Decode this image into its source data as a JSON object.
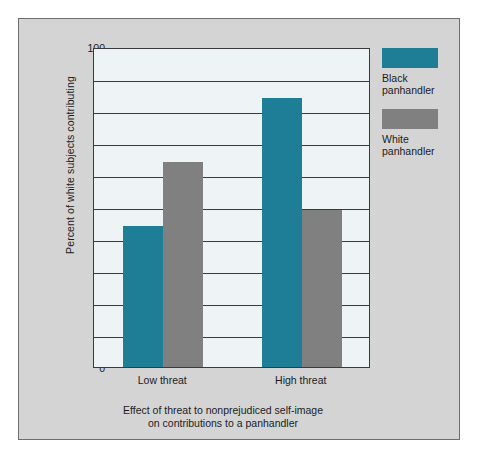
{
  "chart_data": {
    "type": "bar",
    "title": "",
    "caption_line1": "Effect of threat to nonprejudiced self-image",
    "caption_line2": "on contributions to a panhandler",
    "xlabel": "",
    "ylabel": "Percent of white subjects contributing",
    "ylim": [
      0,
      100
    ],
    "ytick_step": 10,
    "grid": true,
    "legend_position": "right",
    "categories": [
      "Low threat",
      "High threat"
    ],
    "yticks": [
      "100",
      "90",
      "80",
      "70",
      "60",
      "50",
      "40",
      "30",
      "20",
      "10",
      "0"
    ],
    "ytick_values": [
      100,
      90,
      80,
      70,
      60,
      50,
      40,
      30,
      20,
      10,
      0
    ],
    "series": [
      {
        "name": "Black panhandler",
        "name_line1": "Black",
        "name_line2": "panhandler",
        "color": "#1e7e96",
        "values": [
          44,
          84
        ]
      },
      {
        "name": "White panhandler",
        "name_line1": "White",
        "name_line2": "panhandler",
        "color": "#808080",
        "values": [
          64,
          49
        ]
      }
    ],
    "colors": {
      "plot_background": "#eef4f5",
      "panel_background": "#d4d4d4",
      "axis": "#3a3a3a",
      "text": "#1c1c1c",
      "black_panhandler": "#1e7e96",
      "white_panhandler": "#808080"
    }
  }
}
